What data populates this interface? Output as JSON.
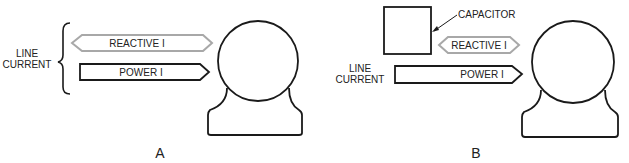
{
  "panels": [
    {
      "id": "A",
      "caption": "A",
      "line_current_label": [
        "LINE",
        "CURRENT"
      ],
      "reactive_label": "REACTIVE I",
      "power_label": "POWER I"
    },
    {
      "id": "B",
      "caption": "B",
      "capacitor_label": "CAPACITOR",
      "line_current_label": [
        "LINE",
        "CURRENT"
      ],
      "reactive_label": "REACTIVE I",
      "power_label": "POWER I"
    }
  ],
  "colors": {
    "stroke": "#1a1a1a",
    "reactive_stroke": "#a8a8a8"
  }
}
